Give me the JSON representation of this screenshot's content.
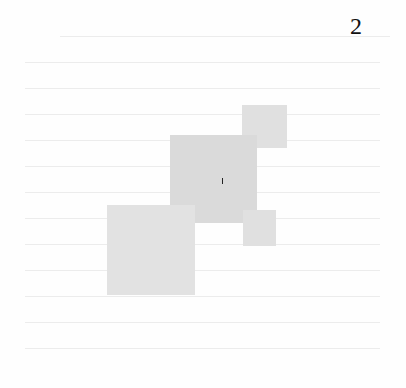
{
  "page": {
    "number": "2",
    "background": "#fefefe"
  },
  "figure": {
    "shapes": [
      {
        "name": "square-top-right",
        "x": 242,
        "y": 105,
        "w": 45,
        "h": 43,
        "color": "#e0e0e0"
      },
      {
        "name": "square-center",
        "x": 170,
        "y": 135,
        "w": 87,
        "h": 88,
        "color": "#dadada"
      },
      {
        "name": "square-lower-right",
        "x": 243,
        "y": 210,
        "w": 33,
        "h": 36,
        "color": "#e0e0e0"
      },
      {
        "name": "square-lower-left",
        "x": 107,
        "y": 205,
        "w": 88,
        "h": 90,
        "color": "#e2e2e2"
      }
    ]
  }
}
